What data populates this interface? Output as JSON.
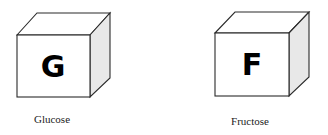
{
  "diagram": {
    "cubes": [
      {
        "letter": "G",
        "label": "Glucose"
      },
      {
        "letter": "F",
        "label": "Fructose"
      }
    ],
    "colors": {
      "outline": "#2a2a2a",
      "side_shade": "#e8e8e8",
      "letter": "#000000"
    }
  }
}
